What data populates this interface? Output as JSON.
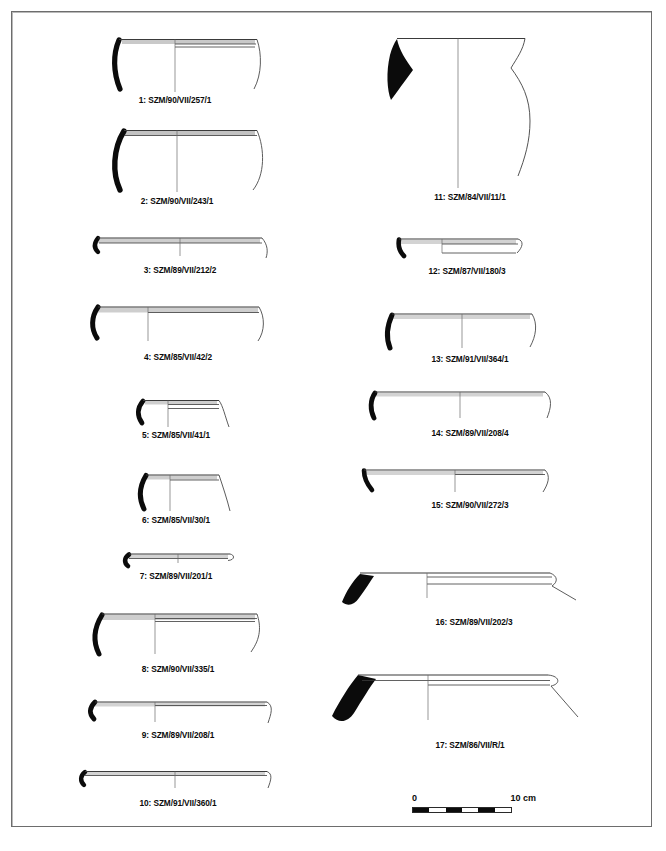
{
  "plate": {
    "title": "Archaeological pottery profile plate",
    "background_color": "#ffffff",
    "frame_color": "#6d6d6d",
    "ink_color": "#0b0b0b",
    "outline_color": "#4a4a4a",
    "figure_count": 17,
    "columns": 2
  },
  "figures": [
    {
      "number": "1",
      "label": "1: SZM/90/VII/257/1",
      "type": "bowl-profile",
      "column": "left"
    },
    {
      "number": "2",
      "label": "2: SZM/90/VII/243/1",
      "type": "bowl-profile",
      "column": "left"
    },
    {
      "number": "3",
      "label": "3: SZM/89/VII/212/2",
      "type": "shallow-bowl-profile",
      "column": "left"
    },
    {
      "number": "4",
      "label": "4: SZM/85/VII/42/2",
      "type": "shallow-bowl-profile",
      "column": "left"
    },
    {
      "number": "5",
      "label": "5: SZM/85/VII/41/1",
      "type": "small-bowl-profile",
      "column": "left"
    },
    {
      "number": "6",
      "label": "6: SZM/85/VII/30/1",
      "type": "small-bowl-profile",
      "column": "left"
    },
    {
      "number": "7",
      "label": "7: SZM/89/VII/201/1",
      "type": "plate-profile",
      "column": "left"
    },
    {
      "number": "8",
      "label": "8: SZM/90/VII/335/1",
      "type": "shallow-bowl-profile",
      "column": "left"
    },
    {
      "number": "9",
      "label": "9: SZM/89/VII/208/1",
      "type": "plate-profile",
      "column": "left"
    },
    {
      "number": "10",
      "label": "10: SZM/91/VII/360/1",
      "type": "plate-profile",
      "column": "left"
    },
    {
      "number": "11",
      "label": "11: SZM/84/VII/11/1",
      "type": "large-jar-profile",
      "column": "right"
    },
    {
      "number": "12",
      "label": "12: SZM/87/VII/180/3",
      "type": "plate-profile",
      "column": "right"
    },
    {
      "number": "13",
      "label": "13: SZM/91/VII/364/1",
      "type": "shallow-bowl-profile",
      "column": "right"
    },
    {
      "number": "14",
      "label": "14: SZM/89/VII/208/4",
      "type": "shallow-bowl-profile",
      "column": "right"
    },
    {
      "number": "15",
      "label": "15: SZM/90/VII/272/3",
      "type": "shallow-bowl-profile",
      "column": "right"
    },
    {
      "number": "16",
      "label": "16: SZM/89/VII/202/3",
      "type": "wide-plate-profile",
      "column": "right"
    },
    {
      "number": "17",
      "label": "17: SZM/86/VII/R/1",
      "type": "wide-plate-profile",
      "column": "right"
    }
  ],
  "scale": {
    "zero_label": "0",
    "max_label": "10 cm",
    "units": "cm",
    "length_cm": 10,
    "segments": 6,
    "filled_segments": 3
  }
}
